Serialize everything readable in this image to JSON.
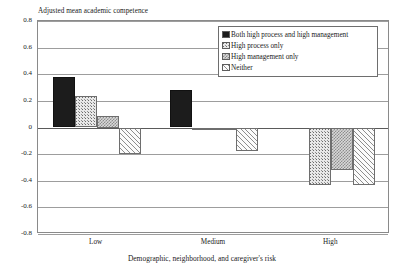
{
  "chart_data": {
    "type": "bar",
    "title": "",
    "ylabel": "Adjusted mean academic competence",
    "xlabel": "Demographic, neighborhood, and caregiver's risk",
    "categories": [
      "Low",
      "Medium",
      "High"
    ],
    "ylim": [
      -0.8,
      0.8
    ],
    "yticks": [
      0.8,
      0.6,
      0.4,
      0.2,
      0,
      -0.2,
      -0.4,
      -0.6,
      -0.8
    ],
    "ytick_labels": [
      "0.8",
      "0.6",
      "0.4",
      "0.2",
      "0",
      "-0.2",
      "-0.4",
      "-0.6",
      "-0.8"
    ],
    "grid": true,
    "legend_position": "upper-right-inside",
    "series": [
      {
        "name": "Both high process and high management",
        "pattern": "solid-black",
        "values": [
          0.38,
          0.28,
          0
        ]
      },
      {
        "name": "High process only",
        "pattern": "fine-dots",
        "values": [
          0.235,
          -0.012,
          -0.43
        ]
      },
      {
        "name": "High management only",
        "pattern": "checkerboard",
        "values": [
          0.09,
          -0.022,
          -0.32
        ]
      },
      {
        "name": "Neither",
        "pattern": "diagonal-hatch",
        "values": [
          -0.2,
          -0.175,
          -0.43
        ]
      }
    ]
  },
  "legend": {
    "items": [
      {
        "label": "Both high process and high management"
      },
      {
        "label": "High process only"
      },
      {
        "label": "High management only"
      },
      {
        "label": "Neither"
      }
    ]
  }
}
